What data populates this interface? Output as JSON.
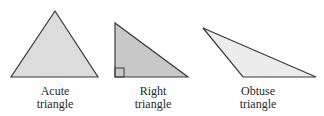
{
  "triangles": [
    {
      "name": "acute",
      "label_line1": "Acute",
      "label_line2": "triangle",
      "points": "55,11 11,77 98,77"
    },
    {
      "name": "right",
      "label_line1": "Right",
      "label_line2": "triangle",
      "points": "115,23 115,77 188,77"
    },
    {
      "name": "obtuse",
      "label_line1": "Obtuse",
      "label_line2": "triangle",
      "points": "203,28 243,77 316,77"
    }
  ],
  "colors": {
    "fill_acute": "#dcdcdc",
    "fill_right": "#c8c8c8",
    "fill_obtuse": "#ececec",
    "stroke": "#3a3a3a"
  }
}
